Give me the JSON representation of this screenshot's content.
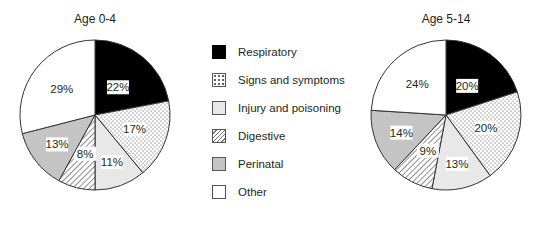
{
  "chart_data": [
    {
      "type": "pie",
      "title": "Age 0-4",
      "categories": [
        "Respiratory",
        "Signs and symptoms",
        "Injury and poisoning",
        "Digestive",
        "Perinatal",
        "Other"
      ],
      "values": [
        22,
        17,
        11,
        8,
        13,
        29
      ],
      "labels": [
        "22%",
        "17%",
        "11%",
        "8%",
        "13%",
        "29%"
      ]
    },
    {
      "type": "pie",
      "title": "Age 5-14",
      "categories": [
        "Respiratory",
        "Signs and symptoms",
        "Injury and poisoning",
        "Digestive",
        "Perinatal",
        "Other"
      ],
      "values": [
        20,
        20,
        13,
        9,
        14,
        24
      ],
      "labels": [
        "20%",
        "20%",
        "13%",
        "9%",
        "14%",
        "24%"
      ]
    }
  ],
  "legend": {
    "position": "center",
    "items": [
      {
        "label": "Respiratory",
        "fill": "#000000",
        "pattern": "solid"
      },
      {
        "label": "Signs and symptoms",
        "fill": "#ffffff",
        "pattern": "dots"
      },
      {
        "label": "Injury and poisoning",
        "fill": "#e8e8e8",
        "pattern": "solid"
      },
      {
        "label": "Digestive",
        "fill": "#ffffff",
        "pattern": "hatch"
      },
      {
        "label": "Perinatal",
        "fill": "#c4c4c4",
        "pattern": "solid"
      },
      {
        "label": "Other",
        "fill": "#ffffff",
        "pattern": "solid"
      }
    ]
  }
}
